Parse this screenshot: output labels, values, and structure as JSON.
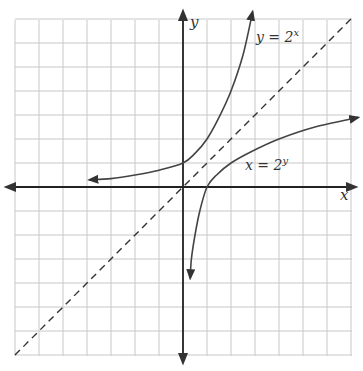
{
  "chart_data": {
    "type": "line",
    "title": "",
    "xlabel": "x",
    "ylabel": "y",
    "xlim": [
      -7,
      7
    ],
    "ylim": [
      -7,
      7
    ],
    "grid": true,
    "grid_step": 1,
    "legend": "none",
    "series": [
      {
        "name": "y = 2^x",
        "label_base": "y = 2",
        "label_exp": "x",
        "style": "solid",
        "color": "#444444",
        "arrows": "both",
        "points": [
          [
            -3.9,
            0.3
          ],
          [
            -3,
            0.35
          ],
          [
            -2,
            0.5
          ],
          [
            -1,
            0.7
          ],
          [
            0,
            1
          ],
          [
            0.5,
            1.4
          ],
          [
            1,
            2
          ],
          [
            1.5,
            2.9
          ],
          [
            2,
            4
          ],
          [
            2.5,
            5.5
          ],
          [
            2.9,
            7.3
          ]
        ]
      },
      {
        "name": "x = 2^y",
        "label_base": "x = 2",
        "label_exp": "y",
        "style": "solid",
        "color": "#444444",
        "arrows": "both",
        "points": [
          [
            0.3,
            -3.8
          ],
          [
            0.35,
            -3
          ],
          [
            0.5,
            -2
          ],
          [
            0.7,
            -1
          ],
          [
            1,
            0
          ],
          [
            1.4,
            0.5
          ],
          [
            2,
            1
          ],
          [
            2.9,
            1.5
          ],
          [
            4,
            2
          ],
          [
            5.5,
            2.5
          ],
          [
            7.3,
            2.9
          ]
        ]
      },
      {
        "name": "y = x",
        "style": "dashed",
        "color": "#333333",
        "arrows": "none",
        "points": [
          [
            -7,
            -7
          ],
          [
            7,
            7
          ]
        ]
      }
    ],
    "colors": {
      "grid": "#c8c8c8",
      "axis": "#222222"
    }
  }
}
